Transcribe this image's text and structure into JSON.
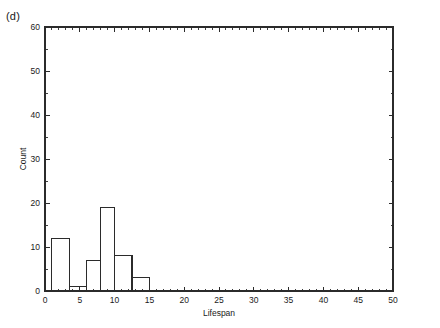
{
  "panel": {
    "label": "(d)"
  },
  "chart_data": {
    "type": "bar",
    "title": "",
    "subtitle": "",
    "xlabel": "Lifespan",
    "ylabel": "Count",
    "xlim": [
      0,
      50
    ],
    "ylim": [
      0,
      60
    ],
    "grid": false,
    "legend": null,
    "x_ticks": [
      0,
      5,
      10,
      15,
      20,
      25,
      30,
      35,
      40,
      45,
      50
    ],
    "x_tick_labels": [
      "0",
      "5",
      "10",
      "15",
      "20",
      "25",
      "30",
      "35",
      "40",
      "45",
      "50"
    ],
    "x_minor_step": 1,
    "y_ticks": [
      0,
      10,
      20,
      30,
      40,
      50,
      60
    ],
    "y_tick_labels": [
      "0",
      "10",
      "20",
      "30",
      "40",
      "50",
      "60"
    ],
    "y_minor_step": 5,
    "bin_edges": [
      1,
      3.5,
      6,
      8,
      10,
      12.5,
      15
    ],
    "categories": [
      "1-3.5",
      "3.5-6",
      "6-8",
      "8-10",
      "10-12.5",
      "12.5-15"
    ],
    "values": [
      12,
      1,
      7,
      19,
      8,
      3
    ],
    "bars": [
      {
        "x0": 1,
        "x1": 3.5,
        "height": 12
      },
      {
        "x0": 3.5,
        "x1": 6,
        "height": 1
      },
      {
        "x0": 6,
        "x1": 8,
        "height": 7
      },
      {
        "x0": 8,
        "x1": 10,
        "height": 19
      },
      {
        "x0": 10,
        "x1": 12.5,
        "height": 8
      },
      {
        "x0": 12.5,
        "x1": 15,
        "height": 3
      }
    ],
    "colors": {
      "bar_fill": "#ffffff",
      "bar_stroke": "#2b2b2b",
      "axis": "#2b2b2b",
      "background": "#ffffff",
      "text": "#1a1a1a"
    }
  }
}
